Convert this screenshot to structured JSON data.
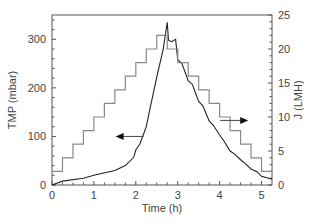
{
  "chart_data": {
    "type": "line",
    "title": "",
    "xlabel": "Time (h)",
    "ylabel": "TMP (mbar)",
    "y2label": "J (LMH)",
    "xlim": [
      0,
      5.25
    ],
    "ylim": [
      0,
      350
    ],
    "y2lim": [
      0,
      25
    ],
    "x_ticks": [
      "0",
      "1",
      "2",
      "3",
      "4",
      "5"
    ],
    "y_ticks": [
      "0",
      "100",
      "200",
      "300"
    ],
    "y2_ticks": [
      "0",
      "5",
      "10",
      "15",
      "20",
      "25"
    ],
    "grid": false,
    "legend": null,
    "annotations": [
      {
        "type": "arrow",
        "direction": "left",
        "target": "TMP",
        "at": [
          1.9,
          100
        ]
      },
      {
        "type": "arrow",
        "direction": "right",
        "target": "J",
        "at": [
          4.3,
          9.5
        ]
      }
    ],
    "series": [
      {
        "name": "TMP",
        "axis": "left",
        "color": "#222222",
        "x": [
          0,
          0.25,
          0.75,
          1.0,
          1.5,
          1.75,
          1.95,
          2.0,
          2.1,
          2.25,
          2.35,
          2.5,
          2.65,
          2.75,
          2.78,
          2.85,
          2.95,
          3.0,
          3.1,
          3.25,
          3.35,
          3.5,
          3.6,
          3.75,
          3.85,
          4.0,
          4.1,
          4.25,
          4.35,
          4.5,
          4.6,
          4.75,
          4.9,
          5.0,
          5.25
        ],
        "values": [
          0,
          8,
          14,
          20,
          30,
          40,
          57,
          72,
          85,
          120,
          162,
          222,
          278,
          335,
          298,
          295,
          300,
          258,
          250,
          215,
          207,
          172,
          163,
          132,
          123,
          103,
          91,
          70,
          64,
          52,
          45,
          33,
          27,
          18,
          12
        ]
      },
      {
        "name": "J (step flux)",
        "axis": "right",
        "color": "#888888",
        "step": true,
        "x": [
          0,
          0.25,
          0.5,
          0.75,
          1.0,
          1.25,
          1.5,
          1.75,
          2.0,
          2.25,
          2.5,
          2.75,
          3.0,
          3.25,
          3.5,
          3.75,
          4.0,
          4.25,
          4.5,
          4.75,
          5.0,
          5.25
        ],
        "values": [
          2,
          4,
          6,
          8,
          10,
          12,
          14,
          16,
          18,
          20,
          22,
          20,
          18,
          16,
          14,
          12,
          10,
          8,
          6,
          4,
          2,
          2
        ]
      }
    ]
  }
}
